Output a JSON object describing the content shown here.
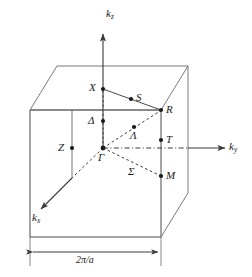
{
  "figure": {
    "type": "diagram",
    "background_color": "#ffffff",
    "line_color": "#3a3a3a",
    "text_color": "#1a1a1a"
  },
  "axes": [
    {
      "id": "kz",
      "base": "k",
      "sub": "z",
      "direction": "up"
    },
    {
      "id": "ky",
      "base": "k",
      "sub": "y",
      "direction": "right"
    },
    {
      "id": "kx",
      "base": "k",
      "sub": "x",
      "direction": "down-left"
    }
  ],
  "symmetry_points": [
    {
      "id": "X",
      "label": "X"
    },
    {
      "id": "S",
      "label": "S"
    },
    {
      "id": "R",
      "label": "R"
    },
    {
      "id": "Delta",
      "label": "Δ"
    },
    {
      "id": "Lambda",
      "label": "Λ"
    },
    {
      "id": "T",
      "label": "T"
    },
    {
      "id": "Z",
      "label": "Z"
    },
    {
      "id": "Gamma",
      "label": "Γ"
    },
    {
      "id": "Sigma",
      "label": "Σ"
    },
    {
      "id": "M",
      "label": "M"
    }
  ],
  "dimension": {
    "label": "2π/a",
    "measures": "cube-edge-width"
  }
}
